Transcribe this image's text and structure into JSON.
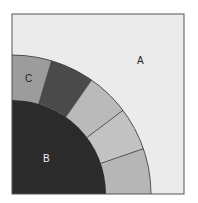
{
  "diagram": {
    "labels": {
      "a": "A",
      "b": "B",
      "c": "C"
    },
    "colors": {
      "page_bg": "#ffffff",
      "region_a": "#ebebeb",
      "region_b": "#2b2b2b",
      "segment_c": "#9c9c9c",
      "segment_dark": "#4a4a4a",
      "segment_light_1": "#bababa",
      "segment_light_2": "#c2c2c2",
      "segment_light_3": "#b6b6b6",
      "frame": "#555555",
      "divider": "#333333",
      "label_dark": "#222222",
      "label_light": "#f0f0f0"
    }
  }
}
